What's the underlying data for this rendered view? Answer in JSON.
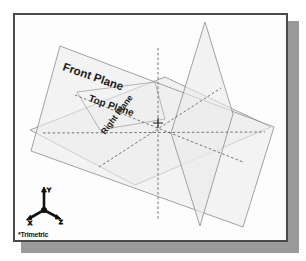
{
  "viewport": {
    "background_color": "#fdfdfd",
    "border_color": "#4a4a4a",
    "shadow_color": "#9a9a9a",
    "plane_fill_color": "#f0f0f0",
    "plane_edge_color": "#8c8c8c",
    "hidden_line_color": "#555555"
  },
  "planes": [
    {
      "id": "front",
      "label": "Front Plane"
    },
    {
      "id": "top",
      "label": "Top Plane"
    },
    {
      "id": "right",
      "label": "Right Plane"
    }
  ],
  "triad": {
    "name": "reference-triad",
    "caption": "*Trimetric",
    "axes": [
      {
        "name": "y-axis",
        "letter": "Y"
      },
      {
        "name": "x-axis",
        "letter": "X"
      },
      {
        "name": "z-axis",
        "letter": "Z"
      }
    ]
  }
}
